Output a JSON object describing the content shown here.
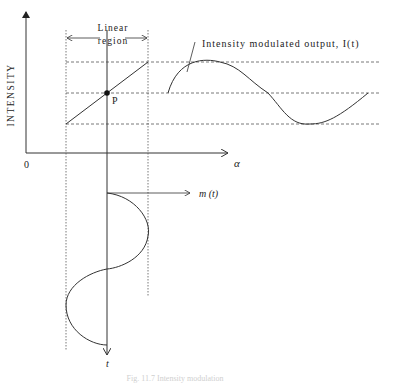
{
  "diagram": {
    "y_axis_label": "INTENSITY",
    "x_axis_label": "α",
    "origin_label": "0",
    "linear_region_label_line1": "Linear",
    "linear_region_label_line2": "region",
    "operating_point_label": "P",
    "output_label": "Intensity modulated output, I(t)",
    "modulation_label": "m (t)",
    "time_axis_label": "t",
    "caption": "Fig. 11.7 Intensity modulation"
  },
  "colors": {
    "line": "#333333",
    "dashed": "#555555",
    "background": "#ffffff"
  }
}
